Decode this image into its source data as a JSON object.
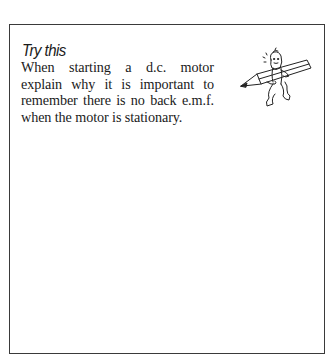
{
  "panel": {
    "title": "Try this",
    "body": "When starting a d.c. motor explain why it is important to remember there is no back e.m.f. when the motor is stationary.",
    "illustration": "pencil-character-icon"
  }
}
